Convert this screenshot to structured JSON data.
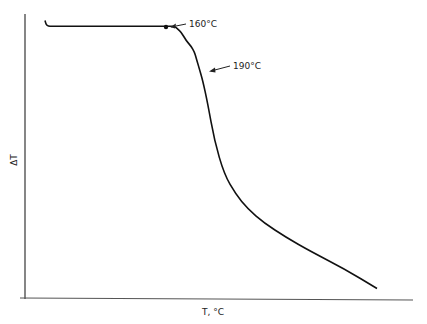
{
  "chart_data": {
    "type": "line",
    "title": "",
    "xlabel": "T, °C",
    "ylabel": "ΔT",
    "grid": false,
    "legend": "none",
    "xlim": [
      0,
      100
    ],
    "ylim": [
      0,
      100
    ],
    "series": [
      {
        "name": "DTA curve",
        "x": [
          0,
          1,
          5,
          20,
          40,
          60,
          75,
          78,
          80,
          82,
          85,
          88,
          90,
          91,
          92,
          93,
          95,
          98,
          102,
          108,
          115,
          122,
          132,
          145,
          160,
          180,
          200
        ],
        "y": [
          97,
          95,
          95,
          95,
          95,
          95,
          95,
          95,
          94,
          93,
          90,
          88,
          86,
          84,
          82,
          80,
          76,
          68,
          55,
          43,
          36,
          31,
          26,
          21,
          16,
          10,
          3
        ]
      }
    ],
    "annotations": [
      {
        "text": "160°C",
        "x": 40,
        "y": 95
      },
      {
        "text": "190°C",
        "x": 89,
        "y": 86
      }
    ]
  }
}
